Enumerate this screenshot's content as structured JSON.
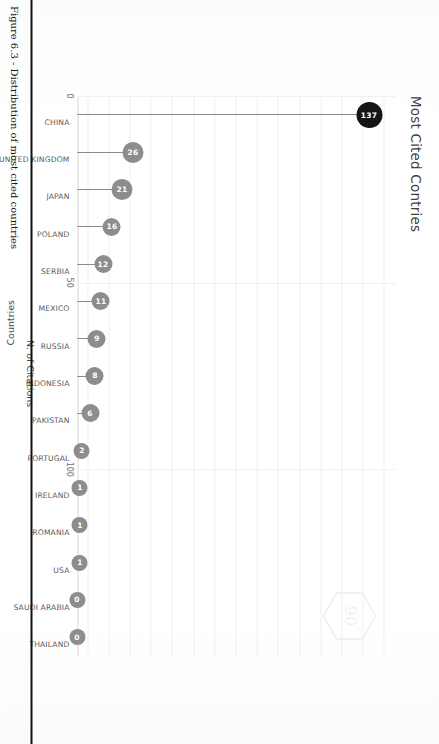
{
  "chart_data": {
    "type": "bar",
    "subtype": "lollipop-horizontal",
    "title": "Most Cited Contries",
    "xlabel": "N. of Citations",
    "ylabel": "Countries",
    "categories": [
      "CHINA",
      "UNITED KINGDOM",
      "JAPAN",
      "POLAND",
      "SERBIA",
      "MEXICO",
      "RUSSIA",
      "INDONESIA",
      "PAKISTAN",
      "PORTUGAL",
      "IRELAND",
      "ROMANIA",
      "USA",
      "SAUDI ARABIA",
      "THAILAND"
    ],
    "values": [
      137,
      26,
      21,
      16,
      12,
      11,
      9,
      8,
      6,
      2,
      1,
      1,
      1,
      0,
      0
    ],
    "xlim": [
      0,
      150
    ],
    "xticks": [
      "0",
      "50",
      "100"
    ],
    "xtick_values": [
      0,
      50,
      100
    ],
    "grid": true,
    "legend": false,
    "highlight_category": "CHINA",
    "colors": {
      "dot_default": "#8d8d8d",
      "dot_highlight": "#151515",
      "stem": "#8a8a8a",
      "grid": "#efefef",
      "text": "#5a5a5a"
    }
  },
  "page": {
    "caption": "Figure 6.3 - Distribution of most cited countries",
    "watermark_label": "logo-watermark"
  }
}
